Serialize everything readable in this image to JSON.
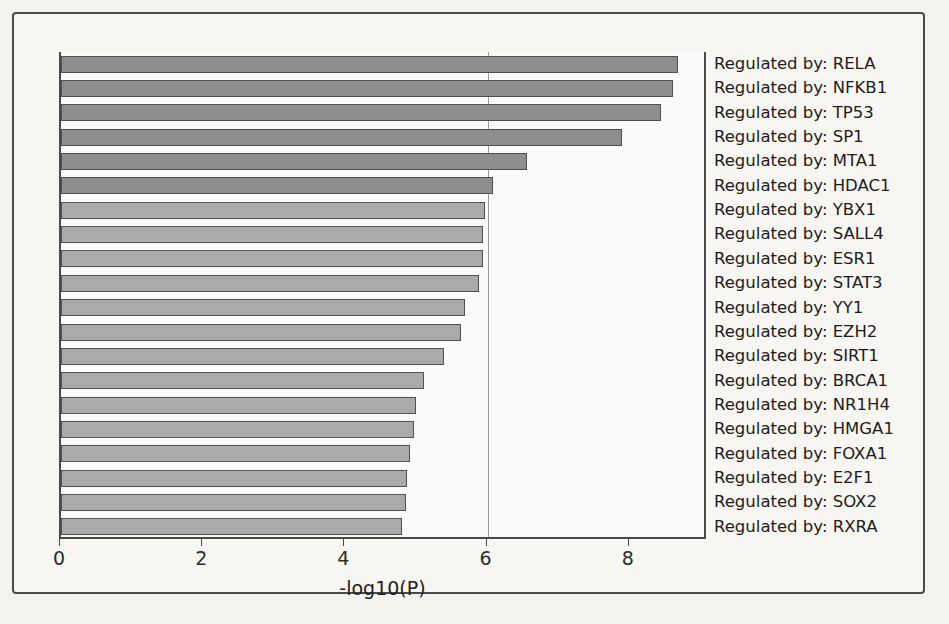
{
  "chart_data": {
    "type": "bar",
    "orientation": "horizontal",
    "title": "",
    "subtitle": "",
    "xlabel": "-log10(P)",
    "ylabel": "",
    "xlim": [
      0,
      9.1
    ],
    "xticks": [
      0,
      2,
      4,
      6,
      8
    ],
    "xtick_labels": [
      "0",
      "2",
      "4",
      "6",
      "8"
    ],
    "grid": "vertical-gridline-at-6",
    "gridline_values": [
      6
    ],
    "legend": "none",
    "bar_colors": {
      "dark": "#8e8e8e",
      "light": "#aaaaaa",
      "edge": "#4f4f4f"
    },
    "categories": [
      "Regulated by: RELA",
      "Regulated by: NFKB1",
      "Regulated by: TP53",
      "Regulated by: SP1",
      "Regulated by: MTA1",
      "Regulated by: HDAC1",
      "Regulated by: YBX1",
      "Regulated by: SALL4",
      "Regulated by: ESR1",
      "Regulated by: STAT3",
      "Regulated by: YY1",
      "Regulated by: EZH2",
      "Regulated by: SIRT1",
      "Regulated by: BRCA1",
      "Regulated by: NR1H4",
      "Regulated by: HMGA1",
      "Regulated by: FOXA1",
      "Regulated by: E2F1",
      "Regulated by: SOX2",
      "Regulated by: RXRA"
    ],
    "values": [
      8.68,
      8.61,
      8.44,
      7.89,
      6.56,
      6.08,
      5.97,
      5.94,
      5.93,
      5.88,
      5.68,
      5.63,
      5.39,
      5.11,
      4.99,
      4.97,
      4.91,
      4.87,
      4.85,
      4.79
    ],
    "shades": [
      "dark",
      "dark",
      "dark",
      "dark",
      "dark",
      "dark",
      "light",
      "light",
      "light",
      "light",
      "light",
      "light",
      "light",
      "light",
      "light",
      "light",
      "light",
      "light",
      "light",
      "light"
    ]
  }
}
